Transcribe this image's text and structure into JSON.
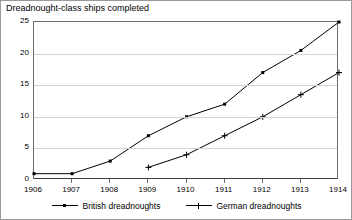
{
  "chart_data": {
    "type": "line",
    "title": "Dreadnought-class ships completed",
    "xlabel": "",
    "ylabel": "",
    "x": [
      1906,
      1907,
      1908,
      1909,
      1910,
      1911,
      1912,
      1913,
      1914
    ],
    "xtick_labels": [
      "1906",
      "1907",
      "1908",
      "1909",
      "1910",
      "1911",
      "1912",
      "1913",
      "1914"
    ],
    "ytick_labels": [
      "0",
      "5",
      "10",
      "15",
      "20",
      "25"
    ],
    "yticks": [
      0,
      5,
      10,
      15,
      20,
      25
    ],
    "ylim": [
      0,
      25
    ],
    "xlim": [
      1906,
      1914
    ],
    "grid": "horizontal",
    "legend_position": "bottom",
    "series": [
      {
        "name": "British dreadnoughts",
        "marker": "square",
        "color": "#000000",
        "x": [
          1906,
          1907,
          1908,
          1909,
          1910,
          1911,
          1912,
          1913,
          1914
        ],
        "values": [
          1,
          1,
          3,
          7,
          10,
          12,
          17,
          20.5,
          25
        ]
      },
      {
        "name": "German dreadnoughts",
        "marker": "plus",
        "color": "#000000",
        "x": [
          1909,
          1910,
          1911,
          1912,
          1913,
          1914
        ],
        "values": [
          2,
          4,
          7,
          10,
          13.5,
          17
        ]
      }
    ]
  },
  "legend": {
    "entries": [
      {
        "label": "British dreadnoughts"
      },
      {
        "label": "German dreadnoughts"
      }
    ]
  }
}
